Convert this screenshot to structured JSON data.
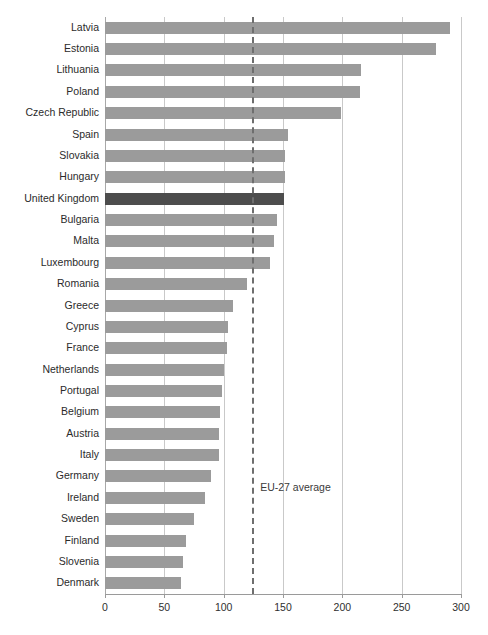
{
  "chart_data": {
    "type": "bar",
    "orientation": "horizontal",
    "title": "",
    "xlabel": "",
    "ylabel": "",
    "xlim": [
      0,
      300
    ],
    "xticks": [
      0,
      50,
      100,
      150,
      200,
      250,
      300
    ],
    "grid": true,
    "legend": null,
    "categories": [
      "Latvia",
      "Estonia",
      "Lithuania",
      "Poland",
      "Czech Republic",
      "Spain",
      "Slovakia",
      "Hungary",
      "United Kingdom",
      "Bulgaria",
      "Malta",
      "Luxembourg",
      "Romania",
      "Greece",
      "Cyprus",
      "France",
      "Netherlands",
      "Portugal",
      "Belgium",
      "Austria",
      "Italy",
      "Germany",
      "Ireland",
      "Sweden",
      "Finland",
      "Slovenia",
      "Denmark"
    ],
    "values": [
      291,
      279,
      216,
      215,
      199,
      154,
      152,
      152,
      151,
      145,
      142,
      139,
      120,
      108,
      104,
      103,
      100,
      99,
      97,
      96,
      96,
      89,
      84,
      75,
      68,
      66,
      64
    ],
    "highlight_category": "United Kingdom",
    "annotations": [
      {
        "label": "EU-27 average",
        "value": 124,
        "style": "dashed-vertical"
      }
    ],
    "colors": {
      "bar": "#9b9b9b",
      "bar_highlight": "#4d4d4d",
      "gridline": "#c9c9c9",
      "axis": "#9a9a9a",
      "average_line": "#6e6e6e",
      "text": "#2b2b2b"
    }
  }
}
